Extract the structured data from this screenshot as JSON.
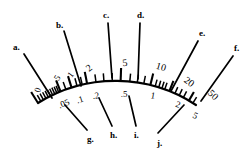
{
  "figure": {
    "name": "curved-logarithmic-scale",
    "ink_color": "#000000",
    "background_color": "#ffffff"
  },
  "arc": {
    "stroke_width": 2.2,
    "start": {
      "x": 38,
      "y": 103
    },
    "apex": {
      "x": 120,
      "y": 81
    },
    "end": {
      "x": 196,
      "y": 105
    }
  },
  "chart_data": {
    "type": "scatter",
    "title": "",
    "xlabel": "",
    "ylabel": "",
    "upper_labels": [
      "0",
      ".5",
      "1",
      "2",
      "5",
      "10",
      "20",
      "50"
    ],
    "lower_labels": [
      ".05",
      ".1",
      ".2",
      ".5",
      "1",
      "2",
      "5"
    ],
    "pointers": [
      "a.",
      "b.",
      "c.",
      "d.",
      "e.",
      "f.",
      "g.",
      "h.",
      "i.",
      "j."
    ]
  },
  "scale_numbers": {
    "upper": [
      {
        "id": "upper-0",
        "text": "0",
        "x": 38,
        "y": 90,
        "rot": -72,
        "size": 9
      },
      {
        "id": "upper-p5",
        "text": ".5",
        "x": 57,
        "y": 79,
        "rot": -58,
        "size": 9
      },
      {
        "id": "upper-1",
        "text": "1",
        "x": 71,
        "y": 75,
        "rot": -52,
        "size": 9
      },
      {
        "id": "upper-2",
        "text": "2",
        "x": 89,
        "y": 68,
        "rot": -38,
        "size": 10
      },
      {
        "id": "upper-5",
        "text": "5",
        "x": 125,
        "y": 63,
        "rot": -6,
        "size": 10
      },
      {
        "id": "upper-10",
        "text": "10",
        "x": 161,
        "y": 67,
        "rot": 16,
        "size": 10
      },
      {
        "id": "upper-20",
        "text": "20",
        "x": 189,
        "y": 82,
        "rot": 36,
        "size": 10
      },
      {
        "id": "upper-50",
        "text": "50",
        "x": 213,
        "y": 95,
        "rot": 44,
        "size": 10
      }
    ],
    "lower": [
      {
        "id": "lower-p05",
        "text": ".05",
        "x": 64,
        "y": 104,
        "rot": -22,
        "size": 9
      },
      {
        "id": "lower-p1",
        "text": ".1",
        "x": 80,
        "y": 100,
        "rot": -18,
        "size": 9
      },
      {
        "id": "lower-p2",
        "text": ".2",
        "x": 96,
        "y": 96,
        "rot": -10,
        "size": 9
      },
      {
        "id": "lower-p5",
        "text": ".5",
        "x": 124,
        "y": 94,
        "rot": 0,
        "size": 9
      },
      {
        "id": "lower-1",
        "text": "1",
        "x": 153,
        "y": 96,
        "rot": 10,
        "size": 9
      },
      {
        "id": "lower-2",
        "text": "2",
        "x": 178,
        "y": 105,
        "rot": 20,
        "size": 9
      },
      {
        "id": "lower-5",
        "text": "5",
        "x": 195,
        "y": 116,
        "rot": 26,
        "size": 9
      }
    ]
  },
  "pointer_labels": [
    {
      "id": "pointer-a",
      "text": "a.",
      "x": 13,
      "y": 43
    },
    {
      "id": "pointer-b",
      "text": "b.",
      "x": 56,
      "y": 21
    },
    {
      "id": "pointer-c",
      "text": "c.",
      "x": 103,
      "y": 11
    },
    {
      "id": "pointer-d",
      "text": "d.",
      "x": 137,
      "y": 11
    },
    {
      "id": "pointer-e",
      "text": "e.",
      "x": 199,
      "y": 29
    },
    {
      "id": "pointer-f",
      "text": "f.",
      "x": 234,
      "y": 44
    },
    {
      "id": "pointer-g",
      "text": "g.",
      "x": 87,
      "y": 135
    },
    {
      "id": "pointer-h",
      "text": "h.",
      "x": 110,
      "y": 131
    },
    {
      "id": "pointer-i",
      "text": "i.",
      "x": 134,
      "y": 131
    },
    {
      "id": "pointer-j",
      "text": "j.",
      "x": 157,
      "y": 139
    }
  ],
  "pointer_lines": [
    {
      "id": "leader-a",
      "x1": 24,
      "y1": 54,
      "x2": 52,
      "y2": 98
    },
    {
      "id": "leader-b",
      "x1": 64,
      "y1": 31,
      "x2": 81,
      "y2": 86
    },
    {
      "id": "leader-c",
      "x1": 108,
      "y1": 23,
      "x2": 112,
      "y2": 78
    },
    {
      "id": "leader-d",
      "x1": 140,
      "y1": 23,
      "x2": 138,
      "y2": 79
    },
    {
      "id": "leader-e",
      "x1": 198,
      "y1": 41,
      "x2": 171,
      "y2": 91
    },
    {
      "id": "leader-f",
      "x1": 233,
      "y1": 56,
      "x2": 201,
      "y2": 101
    },
    {
      "id": "leader-g",
      "x1": 87,
      "y1": 130,
      "x2": 65,
      "y2": 105
    },
    {
      "id": "leader-h",
      "x1": 112,
      "y1": 126,
      "x2": 99,
      "y2": 98
    },
    {
      "id": "leader-i",
      "x1": 136,
      "y1": 126,
      "x2": 129,
      "y2": 96
    },
    {
      "id": "leader-j",
      "x1": 158,
      "y1": 133,
      "x2": 184,
      "y2": 105
    }
  ],
  "ticks": {
    "major": [
      {
        "id": "tick-major-0",
        "t": 0.0,
        "len": 13
      },
      {
        "id": "tick-major-p5",
        "t": 0.152,
        "len": 12
      },
      {
        "id": "tick-major-1",
        "t": 0.222,
        "len": 12
      },
      {
        "id": "tick-major-2",
        "t": 0.318,
        "len": 12
      },
      {
        "id": "tick-major-5",
        "t": 0.52,
        "len": 13
      },
      {
        "id": "tick-major-10",
        "t": 0.7,
        "len": 12
      },
      {
        "id": "tick-major-20",
        "t": 0.82,
        "len": 11
      },
      {
        "id": "tick-major-50",
        "t": 0.95,
        "len": 10
      }
    ],
    "minor": [
      {
        "id": "tick-minor-1",
        "t": 0.02,
        "len": 7
      },
      {
        "id": "tick-minor-2",
        "t": 0.038,
        "len": 7
      },
      {
        "id": "tick-minor-3",
        "t": 0.055,
        "len": 7
      },
      {
        "id": "tick-minor-4",
        "t": 0.071,
        "len": 7
      },
      {
        "id": "tick-minor-5",
        "t": 0.086,
        "len": 7
      },
      {
        "id": "tick-minor-6",
        "t": 0.1,
        "len": 7
      },
      {
        "id": "tick-minor-7",
        "t": 0.114,
        "len": 7
      },
      {
        "id": "tick-minor-8",
        "t": 0.128,
        "len": 7
      },
      {
        "id": "tick-minor-9",
        "t": 0.14,
        "len": 7
      },
      {
        "id": "tick-minor-10",
        "t": 0.186,
        "len": 8
      },
      {
        "id": "tick-minor-11",
        "t": 0.256,
        "len": 8
      },
      {
        "id": "tick-minor-12",
        "t": 0.288,
        "len": 8
      },
      {
        "id": "tick-minor-13",
        "t": 0.372,
        "len": 8
      },
      {
        "id": "tick-minor-14",
        "t": 0.42,
        "len": 8
      },
      {
        "id": "tick-minor-15",
        "t": 0.47,
        "len": 8
      },
      {
        "id": "tick-minor-16",
        "t": 0.575,
        "len": 8
      },
      {
        "id": "tick-minor-17",
        "t": 0.62,
        "len": 8
      },
      {
        "id": "tick-minor-18",
        "t": 0.66,
        "len": 8
      },
      {
        "id": "tick-minor-19",
        "t": 0.73,
        "len": 7
      },
      {
        "id": "tick-minor-20",
        "t": 0.752,
        "len": 7
      },
      {
        "id": "tick-minor-21",
        "t": 0.772,
        "len": 7
      },
      {
        "id": "tick-minor-22",
        "t": 0.79,
        "len": 7
      },
      {
        "id": "tick-minor-23",
        "t": 0.856,
        "len": 7
      },
      {
        "id": "tick-minor-24",
        "t": 0.884,
        "len": 7
      },
      {
        "id": "tick-minor-25",
        "t": 0.912,
        "len": 7
      },
      {
        "id": "tick-minor-26",
        "t": 0.978,
        "len": 7
      }
    ]
  }
}
